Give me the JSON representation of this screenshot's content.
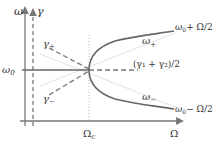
{
  "diagram": {
    "axes": {
      "y_left_label": "ω",
      "y_right_label": "γ",
      "x_label": "Ω",
      "y_tick_label": "ω₀",
      "x_tick_label": "Ω_c"
    },
    "x_tick_label_main": "Ω",
    "x_tick_label_sub": "c",
    "y_tick_label_main": "ω",
    "y_tick_label_sub": "0",
    "curves": {
      "upper_label_main": "ω",
      "upper_label_sub": "+",
      "lower_label_main": "ω",
      "lower_label_sub": "−",
      "upper_end_label": "ω₀+ Ω/2",
      "lower_end_label": "ω₀− Ω/2",
      "upper_end_main": "ω",
      "upper_end_sub": "0",
      "upper_end_rest": "+ Ω/2",
      "lower_end_main": "ω",
      "lower_end_sub": "0",
      "lower_end_rest": "− Ω/2"
    },
    "damping": {
      "gamma_plus_main": "γ",
      "gamma_plus_sub": "+",
      "gamma_minus_main": "γ",
      "gamma_minus_sub": "−",
      "average_label": "(γ₁ + γ₂)/2"
    },
    "colors": {
      "solid_curve": "#666666",
      "axis": "#777777",
      "dashed": "#777777",
      "guide": "#cccccc"
    }
  }
}
